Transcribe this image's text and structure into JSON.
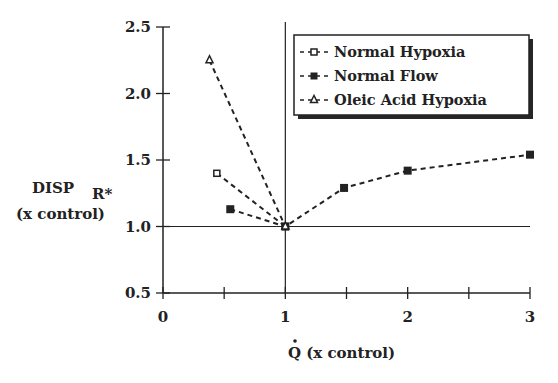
{
  "chart_data": {
    "type": "line",
    "title": "",
    "xlabel": "Q̇ (x control)",
    "xlabel_parts": {
      "symbol": "Q",
      "rest": " (x control)"
    },
    "ylabel": "DISP R* (x control)",
    "ylabel_parts": {
      "main": "DISP",
      "subscript": "R*",
      "line2": "(x control)"
    },
    "xlim": [
      0,
      3
    ],
    "ylim": [
      0.5,
      2.5
    ],
    "x_ticks": [
      0,
      0.5,
      1,
      1.5,
      2,
      2.5,
      3
    ],
    "x_tick_labels": [
      "0",
      "1",
      "2",
      "3"
    ],
    "y_ticks": [
      0.5,
      1.0,
      1.5,
      2.0,
      2.5
    ],
    "y_tick_labels": [
      "0.5",
      "1.0",
      "1.5",
      "2.0",
      "2.5"
    ],
    "reference_lines": {
      "vertical_x": 1,
      "horizontal_y": 1.0
    },
    "grid": false,
    "legend_position": "upper right (boxed)",
    "series": [
      {
        "name": "Normal Hypoxia",
        "marker": "open-square",
        "line": "dashed",
        "x": [
          0.44,
          1.0
        ],
        "y": [
          1.4,
          1.0
        ]
      },
      {
        "name": "Normal Flow",
        "marker": "filled-square",
        "line": "dashed",
        "x": [
          0.55,
          1.0,
          1.48,
          2.0,
          3.0
        ],
        "y": [
          1.13,
          1.0,
          1.29,
          1.42,
          1.54
        ]
      },
      {
        "name": "Oleic Acid Hypoxia",
        "marker": "open-triangle",
        "line": "dashed",
        "x": [
          0.38,
          1.0
        ],
        "y": [
          2.25,
          1.0
        ]
      }
    ]
  },
  "legend": {
    "items": [
      {
        "label": "Normal Hypoxia",
        "marker": "open-square"
      },
      {
        "label": "Normal Flow",
        "marker": "filled-square"
      },
      {
        "label": "Oleic Acid Hypoxia",
        "marker": "open-triangle"
      }
    ]
  },
  "colors": {
    "ink": "#222222",
    "background": "#ffffff"
  }
}
